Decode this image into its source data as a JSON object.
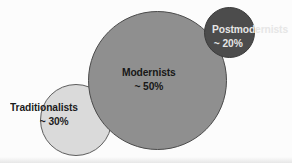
{
  "chart_data": {
    "type": "bubble",
    "title": "",
    "subtitle": "",
    "xlabel": "",
    "ylabel": "",
    "grid": false,
    "legend": "none",
    "note": "Three proportional overlapping circles sized by share of population",
    "categories": [
      "Traditionalists",
      "Modernists",
      "Postmodernists"
    ],
    "values": [
      30,
      20,
      50
    ],
    "series": [
      {
        "name": "Share of population",
        "values": [
          30,
          50,
          20
        ]
      }
    ],
    "bubbles": [
      {
        "name": "Traditionalists",
        "value": 30,
        "value_label": "~ 30%",
        "color": "#dadada",
        "stroke": "#5d5d5d",
        "text_color": "#1c1c1c"
      },
      {
        "name": "Modernists",
        "value": 50,
        "value_label": "~ 50%",
        "color": "#8f8f8f",
        "stroke": "#4a4a4a",
        "text_color": "#171717"
      },
      {
        "name": "Postmodernists",
        "value": 20,
        "value_label": "~ 20%",
        "color": "#4c4c4c",
        "stroke": "#3a3a3a",
        "text_color": "#e6e6e6"
      }
    ]
  },
  "canvas": {
    "background": "#fcfcfc"
  }
}
